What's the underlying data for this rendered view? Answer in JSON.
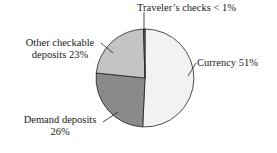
{
  "chart_data": {
    "type": "pie",
    "title": "",
    "categories": [
      "Currency",
      "Demand deposits",
      "Other checkable deposits",
      "Traveler's checks"
    ],
    "values": [
      51,
      26,
      23,
      0.5
    ],
    "value_labels": [
      "51%",
      "26%",
      "23%",
      "< 1%"
    ],
    "colors": [
      "#f2f2f2",
      "#8a8a8a",
      "#c4c4c4",
      "#7a7a7a"
    ],
    "start_angle_deg": 0,
    "direction": "clockwise",
    "legend": "none (callout labels)"
  },
  "labels": {
    "travelers": "Traveler’s checks < 1%",
    "other_line1": "Other checkable",
    "other_line2": "deposits 23%",
    "currency": "Currency 51%",
    "demand_line1": "Demand deposits",
    "demand_line2": "26%"
  }
}
